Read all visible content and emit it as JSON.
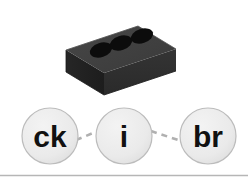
{
  "page": {
    "background_color": "#ffffff",
    "width": 248,
    "height": 192
  },
  "illustration": {
    "name": "brick",
    "description": "Dark grey isometric brick with three holes",
    "body_color": "#3b3b3b",
    "top_face_color": "#3f3f3f",
    "front_face_color": "#303030",
    "side_face_color": "#242424",
    "hole_color": "#0b0b0b",
    "hole_count": 3
  },
  "word_graph": {
    "nodes": [
      {
        "id": "node-ck",
        "label": "ck",
        "cx": 50,
        "cy": 136,
        "r": 28
      },
      {
        "id": "node-i",
        "label": "i",
        "cx": 124,
        "cy": 136,
        "r": 28
      },
      {
        "id": "node-br",
        "label": "br",
        "cx": 208,
        "cy": 136,
        "r": 28
      }
    ],
    "connectors": [
      {
        "id": "connector-ck-i",
        "from": "node-ck",
        "to": "node-i",
        "style": "dashed"
      },
      {
        "id": "connector-i-br",
        "from": "node-i",
        "to": "node-br",
        "style": "dashed"
      }
    ],
    "node_fill_color": "#ececec",
    "node_stroke_color": "#b8b8b8",
    "node_text_color": "#111111",
    "connector_color": "#b0b0b0"
  },
  "divider": {
    "name": "bottom-rule",
    "color": "#b6b6b6",
    "y": 175
  }
}
